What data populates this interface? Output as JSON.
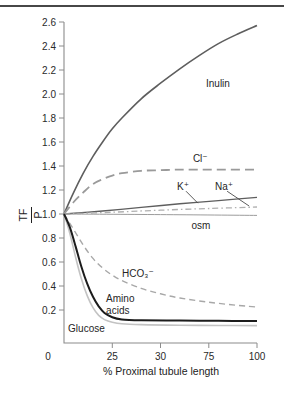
{
  "figure": {
    "background": "#ffffff",
    "top_rule_color": "#474747",
    "axis_color": "#8c8c8c",
    "text_color": "#262626"
  },
  "y_axis": {
    "fraction_numerator": "TF",
    "fraction_denominator": "P",
    "ticks": [
      {
        "v": 2.6,
        "label": "2.6"
      },
      {
        "v": 2.4,
        "label": "2.4"
      },
      {
        "v": 2.2,
        "label": "2.2"
      },
      {
        "v": 2.0,
        "label": "2.0"
      },
      {
        "v": 1.8,
        "label": "1.8"
      },
      {
        "v": 1.6,
        "label": "1.6"
      },
      {
        "v": 1.4,
        "label": "1.4"
      },
      {
        "v": 1.2,
        "label": "1.2"
      },
      {
        "v": 1.0,
        "label": "1.0"
      },
      {
        "v": 0.8,
        "label": "0.8"
      },
      {
        "v": 0.6,
        "label": "0.6"
      },
      {
        "v": 0.4,
        "label": "0.4"
      },
      {
        "v": 0.2,
        "label": "0.2"
      }
    ]
  },
  "x_axis": {
    "title": "% Proximal tubule length",
    "ticks": [
      {
        "v": 0,
        "label": "0"
      },
      {
        "v": 25,
        "label": "25"
      },
      {
        "v": 50,
        "label": "30"
      },
      {
        "v": 75,
        "label": "75"
      },
      {
        "v": 100,
        "label": "100"
      }
    ]
  },
  "chart_data": {
    "type": "line",
    "title": "",
    "xlabel": "% Proximal tubule length",
    "ylabel": "TF/P",
    "xlim": [
      0,
      100
    ],
    "ylim": [
      0,
      2.6
    ],
    "grid": false,
    "legend": "inline-labels",
    "series": [
      {
        "id": "inulin",
        "name": "Inulin",
        "color": "#5e5e5e",
        "width": 1.6,
        "dash": null,
        "points": [
          [
            0,
            1.0
          ],
          [
            5,
            1.18
          ],
          [
            10,
            1.34
          ],
          [
            15,
            1.48
          ],
          [
            20,
            1.6
          ],
          [
            25,
            1.71
          ],
          [
            30,
            1.8
          ],
          [
            40,
            1.96
          ],
          [
            50,
            2.09
          ],
          [
            60,
            2.21
          ],
          [
            70,
            2.32
          ],
          [
            80,
            2.42
          ],
          [
            90,
            2.5
          ],
          [
            100,
            2.57
          ]
        ]
      },
      {
        "id": "cl",
        "name": "Cl⁻",
        "color": "#9a9a9a",
        "width": 1.8,
        "dash": "9 5",
        "points": [
          [
            0,
            1.0
          ],
          [
            5,
            1.1
          ],
          [
            10,
            1.18
          ],
          [
            15,
            1.25
          ],
          [
            20,
            1.29
          ],
          [
            25,
            1.32
          ],
          [
            30,
            1.34
          ],
          [
            40,
            1.36
          ],
          [
            50,
            1.365
          ],
          [
            60,
            1.37
          ],
          [
            75,
            1.37
          ],
          [
            100,
            1.37
          ]
        ]
      },
      {
        "id": "k",
        "name": "K⁺",
        "color": "#5e5e5e",
        "width": 1.4,
        "dash": null,
        "points": [
          [
            0,
            1.0
          ],
          [
            20,
            1.025
          ],
          [
            40,
            1.055
          ],
          [
            60,
            1.085
          ],
          [
            80,
            1.112
          ],
          [
            100,
            1.138
          ]
        ]
      },
      {
        "id": "na",
        "name": "Na⁺",
        "color": "#b0b0b0",
        "width": 1.3,
        "dash": "6 3 1.5 3",
        "points": [
          [
            0,
            1.0
          ],
          [
            25,
            1.015
          ],
          [
            50,
            1.032
          ],
          [
            75,
            1.046
          ],
          [
            100,
            1.058
          ]
        ]
      },
      {
        "id": "osm",
        "name": "osm",
        "color": "#9c9c9c",
        "width": 1.0,
        "dash": null,
        "points": [
          [
            0,
            1.0
          ],
          [
            50,
            0.995
          ],
          [
            100,
            0.988
          ]
        ]
      },
      {
        "id": "hco3",
        "name": "HCO₃⁻",
        "color": "#a8a8a8",
        "width": 1.4,
        "dash": "6 4",
        "points": [
          [
            0,
            1.0
          ],
          [
            5,
            0.87
          ],
          [
            10,
            0.74
          ],
          [
            15,
            0.63
          ],
          [
            20,
            0.55
          ],
          [
            25,
            0.49
          ],
          [
            30,
            0.445
          ],
          [
            40,
            0.38
          ],
          [
            50,
            0.335
          ],
          [
            60,
            0.3
          ],
          [
            75,
            0.265
          ],
          [
            90,
            0.238
          ],
          [
            100,
            0.225
          ]
        ]
      },
      {
        "id": "glucose",
        "name": "Glucose",
        "color": "#c3c3c3",
        "width": 1.6,
        "dash": null,
        "points": [
          [
            0,
            1.0
          ],
          [
            3,
            0.84
          ],
          [
            6,
            0.64
          ],
          [
            9,
            0.46
          ],
          [
            12,
            0.32
          ],
          [
            15,
            0.22
          ],
          [
            18,
            0.155
          ],
          [
            21,
            0.12
          ],
          [
            25,
            0.098
          ],
          [
            30,
            0.085
          ],
          [
            40,
            0.078
          ],
          [
            60,
            0.073
          ],
          [
            80,
            0.071
          ],
          [
            100,
            0.07
          ]
        ]
      },
      {
        "id": "amino-acids",
        "name": "Amino acids",
        "color": "#1c1c1c",
        "width": 2.0,
        "dash": null,
        "points": [
          [
            0,
            1.0
          ],
          [
            3,
            0.89
          ],
          [
            6,
            0.73
          ],
          [
            9,
            0.56
          ],
          [
            12,
            0.42
          ],
          [
            15,
            0.31
          ],
          [
            18,
            0.23
          ],
          [
            21,
            0.175
          ],
          [
            25,
            0.14
          ],
          [
            30,
            0.122
          ],
          [
            40,
            0.115
          ],
          [
            60,
            0.112
          ],
          [
            80,
            0.11
          ],
          [
            100,
            0.108
          ]
        ]
      }
    ],
    "annotations": [
      {
        "id": "inulin-label",
        "text": "Inulin",
        "x": 73.6,
        "y": 2.058,
        "anchor": "start"
      },
      {
        "id": "cl-label",
        "text": "Cl⁻",
        "x": 66.8,
        "y": 1.433,
        "anchor": "start"
      },
      {
        "id": "k-label",
        "text": "K⁺",
        "x": 61.7,
        "y": 1.2,
        "anchor": "middle"
      },
      {
        "id": "na-label",
        "text": "Na⁺",
        "x": 82.9,
        "y": 1.2,
        "anchor": "middle"
      },
      {
        "id": "osm-label",
        "text": "osm",
        "x": 71.0,
        "y": 0.875,
        "anchor": "middle"
      },
      {
        "id": "hco3-label",
        "text": "HCO₃⁻",
        "x": 30.1,
        "y": 0.475,
        "anchor": "start"
      },
      {
        "id": "amino-label-line1",
        "text": "Amino",
        "x": 21.8,
        "y": 0.267,
        "anchor": "start"
      },
      {
        "id": "amino-label-line2",
        "text": "acids",
        "x": 21.8,
        "y": 0.167,
        "anchor": "start"
      },
      {
        "id": "glucose-label",
        "text": "Glucose",
        "x": 2.1,
        "y": 0.017,
        "anchor": "start"
      }
    ],
    "leader_lines": [
      {
        "id": "k-leader",
        "from": [
          63.2,
          1.19
        ],
        "to": [
          69.4,
          1.09
        ]
      },
      {
        "id": "na-leader",
        "from": [
          84.5,
          1.19
        ],
        "to": [
          95.9,
          1.067
        ]
      }
    ]
  }
}
